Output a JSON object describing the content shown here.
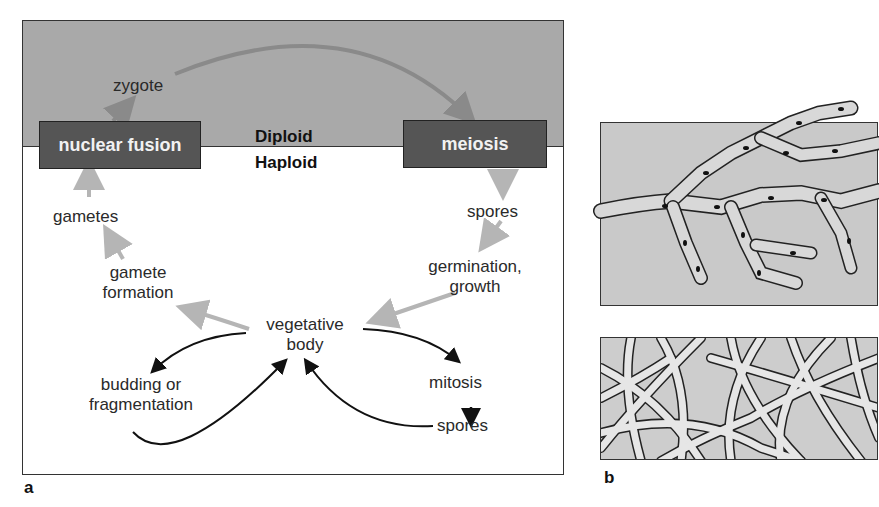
{
  "figure": {
    "panel_a": {
      "letter": "a",
      "zones": {
        "diploid": "Diploid",
        "haploid": "Haploid"
      },
      "boxes": {
        "nuclear_fusion": "nuclear fusion",
        "meiosis": "meiosis"
      },
      "labels": {
        "zygote": "zygote",
        "spores_top": "spores",
        "germination_1": "germination,",
        "germination_2": "growth",
        "vegetative_1": "vegetative",
        "vegetative_2": "body",
        "gamete_formation_1": "gamete",
        "gamete_formation_2": "formation",
        "gametes": "gametes",
        "budding_1": "budding or",
        "budding_2": "fragmentation",
        "mitosis": "mitosis",
        "spores_bottom": "spores"
      },
      "colors": {
        "diploid_bg": "#a9a9a9",
        "box_bg": "#555555",
        "sexual_arrow": "#8a8a8a",
        "light_arrow": "#b5b5b5",
        "asexual_arrow": "#111111"
      }
    },
    "panel_b": {
      "letter": "b",
      "images": [
        "hyphae-with-septa-illustration",
        "mycelium-network-illustration"
      ]
    }
  }
}
